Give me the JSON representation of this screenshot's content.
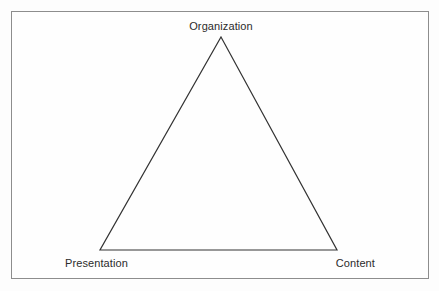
{
  "figure": {
    "type": "triangle-diagram",
    "title": "",
    "background_color": "#fdfdfd",
    "frame": {
      "border_color": "#8d8d8d",
      "fill_color": "#fefefe",
      "x": 11,
      "y": 11,
      "width": 418,
      "height": 268
    },
    "shape": {
      "name": "triangle",
      "stroke_color": "#333333",
      "stroke_width": 1.2,
      "fill": "none",
      "vertices": [
        {
          "id": "apex",
          "x": 221,
          "y": 37
        },
        {
          "id": "bottom-left",
          "x": 100,
          "y": 250
        },
        {
          "id": "bottom-right",
          "x": 337,
          "y": 250
        }
      ]
    },
    "labels": {
      "top": "Organization",
      "bottom_left": "Presentation",
      "bottom_right": "Content"
    },
    "text_color": "#2b2b2b"
  }
}
